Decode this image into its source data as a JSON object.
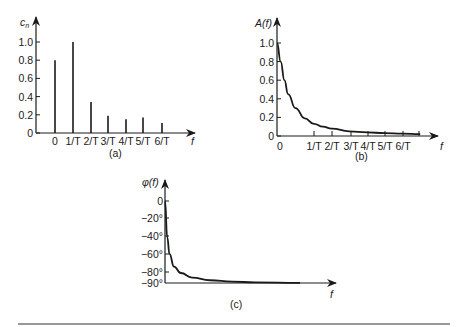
{
  "chart_data": [
    {
      "id": "a",
      "type": "bar",
      "title": "",
      "caption": "(a)",
      "ylabel": "c_n",
      "ylabel_main": "c",
      "ylabel_sub": "n",
      "xlabel": "f",
      "categories": [
        "0",
        "1/T",
        "2/T",
        "3/T",
        "4/T",
        "5/T",
        "6/T"
      ],
      "values": [
        0.8,
        1.0,
        0.34,
        0.19,
        0.15,
        0.17,
        0.11
      ],
      "yticks": [
        "0",
        "0.2",
        "0.4",
        "0.6",
        "0.8",
        "1.0"
      ],
      "ylim": [
        0,
        1.0
      ],
      "grid": false,
      "style": "stem"
    },
    {
      "id": "b",
      "type": "line",
      "title": "",
      "caption": "(b)",
      "ylabel": "A(f)",
      "xlabel": "f",
      "xticks": [
        "0",
        "1/T",
        "2/T",
        "3/T",
        "4/T",
        "5/T",
        "6/T"
      ],
      "yticks": [
        "0",
        "0.2",
        "0.4",
        "0.6",
        "0.8",
        "1.0"
      ],
      "ylim": [
        0,
        1.0
      ],
      "x": [
        0,
        0.1,
        0.2,
        0.3,
        0.5,
        0.75,
        1,
        1.5,
        2,
        3,
        4,
        5,
        6,
        7
      ],
      "y": [
        1.0,
        0.8,
        0.6,
        0.45,
        0.3,
        0.19,
        0.13,
        0.1,
        0.08,
        0.05,
        0.04,
        0.03,
        0.025,
        0.02
      ],
      "grid": false
    },
    {
      "id": "c",
      "type": "line",
      "title": "",
      "caption": "(c)",
      "ylabel": "φ(f)",
      "xlabel": "f",
      "yticks": [
        "0",
        "−20°",
        "−40°",
        "−60°",
        "−80°",
        "−90°"
      ],
      "ylim": [
        -90,
        0
      ],
      "x": [
        0,
        0.05,
        0.1,
        0.2,
        0.35,
        0.6,
        1.0,
        1.5,
        2.0,
        3.0
      ],
      "y": [
        0,
        -40,
        -58,
        -72,
        -79,
        -84,
        -87,
        -88.5,
        -89.3,
        -89.8
      ],
      "grid": false
    }
  ]
}
